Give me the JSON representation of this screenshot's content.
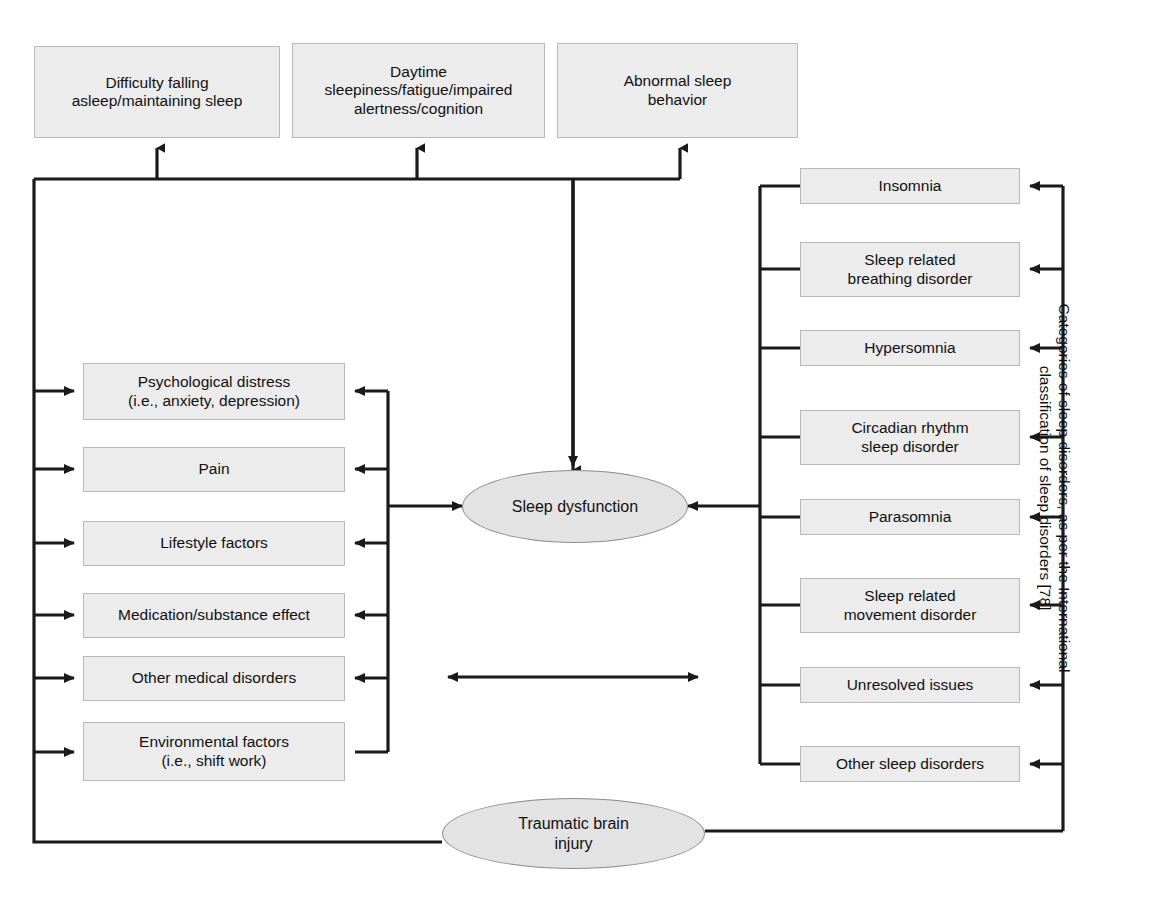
{
  "figure": {
    "line_color": "#1a1a1a",
    "box_fill": "#ececec",
    "box_border": "#b9b9b9",
    "ellipse_fill": "#e3e3e3",
    "ellipse_border": "#8b8b8b"
  },
  "symptoms": {
    "group_label": "Sleep dysfunction symptoms",
    "boxes": [
      {
        "id": "difficulty-falling-asleep",
        "label": "Difficulty falling\nasleep/maintaining sleep"
      },
      {
        "id": "daytime-sleepiness",
        "label": "Daytime\nsleepiness/fatigue/impaired\nalertness/cognition"
      },
      {
        "id": "abnormal-sleep-behavior",
        "label": "Abnormal sleep\nbehavior"
      }
    ]
  },
  "contributors": {
    "group_label": "Contributing factors",
    "boxes": [
      {
        "id": "psychological-distress",
        "label": "Psychological distress\n(i.e., anxiety, depression)"
      },
      {
        "id": "pain",
        "label": "Pain"
      },
      {
        "id": "lifestyle-factors",
        "label": "Lifestyle factors"
      },
      {
        "id": "medication-substance-effect",
        "label": "Medication/substance effect"
      },
      {
        "id": "other-medical-disorders",
        "label": "Other medical disorders"
      },
      {
        "id": "environmental-factors",
        "label": "Environmental factors\n(i.e., shift work)"
      }
    ]
  },
  "categories": {
    "side_label": "Categories of sleep disorders, as per the International\nclassification of sleep disorders [78]",
    "boxes": [
      {
        "id": "insomnia",
        "label": "Insomnia"
      },
      {
        "id": "sleep-related-breathing-disorder",
        "label": "Sleep related\nbreathing disorder"
      },
      {
        "id": "hypersomnia",
        "label": "Hypersomnia"
      },
      {
        "id": "circadian-rhythm-sleep-disorder",
        "label": "Circadian rhythm\nsleep disorder"
      },
      {
        "id": "parasomnia",
        "label": "Parasomnia"
      },
      {
        "id": "sleep-related-movement-disorder",
        "label": "Sleep related\nmovement disorder"
      },
      {
        "id": "unresolved-issues",
        "label": "Unresolved issues"
      },
      {
        "id": "other-sleep-disorders",
        "label": "Other sleep disorders"
      }
    ]
  },
  "core": {
    "sleep_dysfunction": "Sleep dysfunction",
    "traumatic_brain_injury": "Traumatic brain\ninjury"
  }
}
